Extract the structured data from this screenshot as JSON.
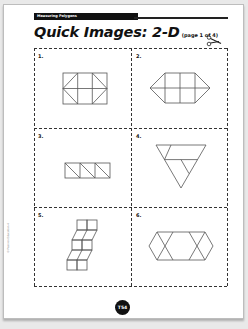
{
  "header": {
    "unit_label": "Measuring Polygons",
    "title": "Quick Images: 2-D",
    "subtitle": "(page 1 of 4)"
  },
  "cards": [
    {
      "number": "1.",
      "figure": "rectangle-with-triangles"
    },
    {
      "number": "2.",
      "figure": "elongated-hexagon-grid"
    },
    {
      "number": "3.",
      "figure": "three-squares-diagonals"
    },
    {
      "number": "4.",
      "figure": "inverted-triangle-subdivided"
    },
    {
      "number": "5.",
      "figure": "stepped-squares-rhombi"
    },
    {
      "number": "6.",
      "figure": "hexagon-with-crossed-ends"
    }
  ],
  "footer": {
    "page_number": "T54",
    "copyright": "© Pearson Education 4"
  },
  "icons": {
    "scissors": "scissors-icon"
  }
}
